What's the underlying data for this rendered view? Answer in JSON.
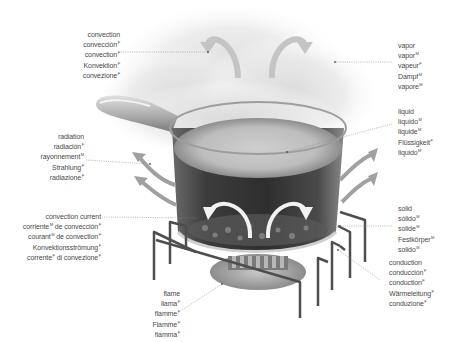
{
  "diagram": {
    "colors": {
      "text": "#4a4a4a",
      "leader_line": "#8a8a8a",
      "arrow_gray": "#9a9a9a",
      "pot_dark": "#3a3a3a",
      "steam": "#e6e6e6",
      "burner": "#a9a9a9"
    },
    "labels": {
      "convection": {
        "lines": [
          {
            "text": "convection",
            "g": ""
          },
          {
            "text": "convección",
            "g": "F"
          },
          {
            "text": "convection",
            "g": "F"
          },
          {
            "text": "Konvektion",
            "g": "F"
          },
          {
            "text": "convezione",
            "g": "F"
          }
        ]
      },
      "vapor": {
        "lines": [
          {
            "text": "vapor",
            "g": ""
          },
          {
            "text": "vapor",
            "g": "M"
          },
          {
            "text": "vapeur",
            "g": "F"
          },
          {
            "text": "Dampf",
            "g": "M"
          },
          {
            "text": "vapore",
            "g": "M"
          }
        ]
      },
      "liquid": {
        "lines": [
          {
            "text": "liquid",
            "g": ""
          },
          {
            "text": "líquido",
            "g": "M"
          },
          {
            "text": "liquide",
            "g": "M"
          },
          {
            "text": "Flüssigkeit",
            "g": "F"
          },
          {
            "text": "liquido",
            "g": "M"
          }
        ]
      },
      "radiation": {
        "lines": [
          {
            "text": "radiation",
            "g": ""
          },
          {
            "text": "radiación",
            "g": "F"
          },
          {
            "text": "rayonnement",
            "g": "M"
          },
          {
            "text": "Strahlung",
            "g": "F"
          },
          {
            "text": "radiazione",
            "g": "F"
          }
        ]
      },
      "convection_current": {
        "lines": [
          {
            "text": "convection current",
            "g": ""
          },
          {
            "text": "corriente",
            "g": "M",
            "tail": " de convección",
            "tail_g": "F"
          },
          {
            "text": "courant",
            "g": "M",
            "tail": " de convection",
            "tail_g": "F"
          },
          {
            "text": "Konvektionsströmung",
            "g": "F"
          },
          {
            "text": "corrente",
            "g": "F",
            "tail": " di convezione",
            "tail_g": "F"
          }
        ]
      },
      "solid": {
        "lines": [
          {
            "text": "solid",
            "g": ""
          },
          {
            "text": "sólido",
            "g": "M"
          },
          {
            "text": "solide",
            "g": "M"
          },
          {
            "text": "Festkörper",
            "g": "M"
          },
          {
            "text": "solido",
            "g": "M"
          }
        ]
      },
      "conduction": {
        "lines": [
          {
            "text": "conduction",
            "g": ""
          },
          {
            "text": "conducción",
            "g": "F"
          },
          {
            "text": "conduction",
            "g": "F"
          },
          {
            "text": "Wärmeleitung",
            "g": "F"
          },
          {
            "text": "conduzione",
            "g": "F"
          }
        ]
      },
      "flame": {
        "lines": [
          {
            "text": "flame",
            "g": ""
          },
          {
            "text": "llama",
            "g": "F"
          },
          {
            "text": "flamme",
            "g": "F"
          },
          {
            "text": "Flamme",
            "g": "F"
          },
          {
            "text": "fiamma",
            "g": "F"
          }
        ]
      }
    }
  }
}
